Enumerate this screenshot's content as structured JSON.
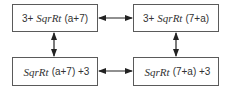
{
  "diagram": {
    "nodes": [
      {
        "id": "top-left",
        "prefix": "3+",
        "func": "SqrRt",
        "suffix": "(a+7)"
      },
      {
        "id": "top-right",
        "prefix": "3+",
        "func": "SqrRt",
        "suffix": "(7+a)"
      },
      {
        "id": "bottom-left",
        "prefix": "",
        "func": "SqrRt",
        "suffix": "(a+7) +3"
      },
      {
        "id": "bottom-right",
        "prefix": "",
        "func": "SqrRt",
        "suffix": "(7+a) +3"
      }
    ],
    "edges": [
      {
        "from": "top-left",
        "to": "top-right",
        "type": "bidirectional"
      },
      {
        "from": "bottom-left",
        "to": "bottom-right",
        "type": "bidirectional"
      },
      {
        "from": "top-left",
        "to": "bottom-left",
        "type": "bidirectional"
      },
      {
        "from": "top-right",
        "to": "bottom-right",
        "type": "bidirectional"
      }
    ],
    "colors": {
      "border": "#5a5a5a",
      "arrow": "#222222",
      "text": "#333333"
    }
  }
}
